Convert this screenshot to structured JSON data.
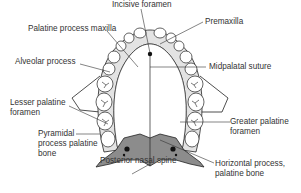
{
  "diagram": {
    "colors": {
      "palatine_bone": "#8c8c8c",
      "alveolar_band": "#e3e3e3",
      "outline": "#222222",
      "leader_line": "#333333",
      "text": "#333333"
    },
    "labels": {
      "incisive_foramen": "Incisive foramen",
      "premaxilla": "Premaxilla",
      "palatine_process_maxilla": "Palatine process maxilla",
      "alveolar_process": "Alveolar process",
      "midpalatal_suture": "Midpalatal suture",
      "lesser_palatine_foramen_1": "Lesser palatine",
      "lesser_palatine_foramen_2": "foramen",
      "greater_palatine_foramen_1": "Greater palatine",
      "greater_palatine_foramen_2": "foramen",
      "pyramidal_process_1": "Pyramidal",
      "pyramidal_process_2": "process palatine",
      "pyramidal_process_3": "bone",
      "posterior_nasal_spine": "Posterior nasal spine",
      "horizontal_process_1": "Horizontal process,",
      "horizontal_process_2": "palatine bone"
    }
  }
}
